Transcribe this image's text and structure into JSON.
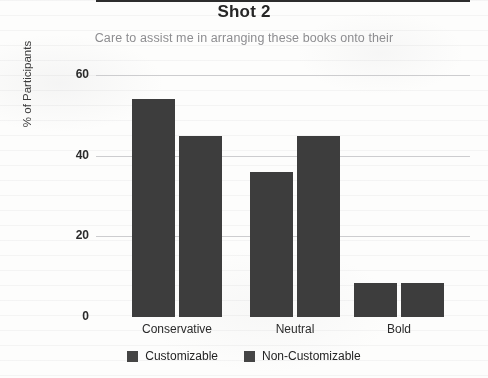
{
  "header": {
    "title": "Shot 2",
    "subtitle": "Care to assist me in arranging these books onto their"
  },
  "legend": {
    "items": [
      {
        "label": "Customizable",
        "color": "#454545"
      },
      {
        "label": "Non-Customizable",
        "color": "#454545"
      }
    ]
  },
  "axes": {
    "ylabel": "% of Participants",
    "yticks": [
      "0",
      "20",
      "40",
      "60"
    ],
    "xticks": [
      "Conservative",
      "Neutral",
      "Bold"
    ]
  },
  "chart_data": {
    "type": "bar",
    "title": "Shot 2",
    "subtitle": "Care to assist me in arranging these books onto their",
    "categories": [
      "Conservative",
      "Neutral",
      "Bold"
    ],
    "series": [
      {
        "name": "Customizable",
        "values": [
          54,
          36,
          8.5
        ],
        "color": "#3d3d3d"
      },
      {
        "name": "Non-Customizable",
        "values": [
          45,
          45,
          8.5
        ],
        "color": "#3d3d3d"
      }
    ],
    "xlabel": "",
    "ylabel": "% of Participants",
    "ylim": [
      0,
      60
    ],
    "ytick_values": [
      0,
      20,
      40,
      60
    ],
    "grid": true,
    "legend_position": "bottom"
  }
}
